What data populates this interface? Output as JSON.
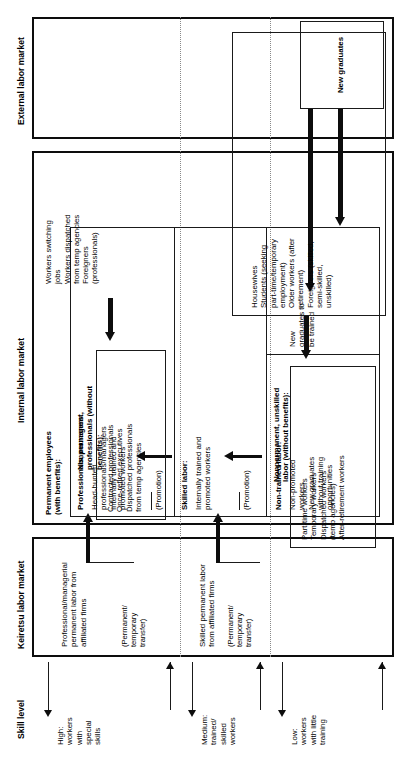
{
  "figure": {
    "axis_label": "Skill level"
  },
  "columns": [
    {
      "id": "skill-level",
      "label": "Skill level"
    },
    {
      "id": "keiretsu",
      "label": "Keiretsu labor market"
    },
    {
      "id": "internal",
      "label": "Internal labor market"
    },
    {
      "id": "external",
      "label": "External labor market"
    }
  ],
  "skill_bands": [
    {
      "id": "high",
      "label": "High:\nworkers\nwith\nspecial\nskills"
    },
    {
      "id": "medium",
      "label": "Medium:\ntrained/\nskilled\nworkers"
    },
    {
      "id": "low",
      "label": "Low:\nworkers\nwith little\ntraining"
    }
  ],
  "keiretsu": {
    "high": {
      "text": "Professional/managerial\npermanent labor from\naffiliated firms",
      "transfer_note": "(Permanent/\ntemporary\ntransfer)"
    },
    "medium": {
      "text": "Skilled permanent labor\nfrom affiliated firms",
      "transfer_note": "(Permanent/\ntemporary\ntransfer)"
    },
    "low": {
      "text": ""
    }
  },
  "internal": {
    "permanent": {
      "heading": "Permanent employees\n(with benefits):",
      "groups": [
        {
          "heading": "Professionals, managers:",
          "items": "Head-hunted\nprofessionals/managers\nInternally trained and\npromoted workers",
          "promotion_note": "(Promotion)"
        },
        {
          "heading": "Skilled labor:",
          "items": "Internally trained and\npromoted workers",
          "promotion_note": "(Promotion)"
        },
        {
          "heading": "Non-trained labor:",
          "items": "Non-promoted\nworkers\nNew graduates\nwithout training\nopportunities",
          "side_note": "New\ngraduates to\nbe trained"
        }
      ]
    },
    "nonpermanent_professionals": {
      "heading": "Nonpermanent,\nprofessionals (without\nbenefits):",
      "items": "Contracted professionals\nOnce-retired executives\nDispatched professionals\nfrom temp agencies"
    },
    "nonpermanent_unskilled": {
      "heading": "Nonpermanent, unskilled\nlabor (without benefits):",
      "items": "Part-time workers\nTemporary workers\nDispatched workers\n(temp agencies)\nAfter-retirement workers"
    }
  },
  "external": {
    "professional_pool": {
      "items": "Workers switching\njobs\nWorkers dispatched\nfrom temp agencies\nForeigners\n(professionals)"
    },
    "unskilled_pool": {
      "items": "Housewives\nStudents (seeking\npart-time/temporary\nemployment)\nOlder workers (after\nretirement)\nForeigners (skilled,\nsemi-skilled,\nunskilled)"
    }
  },
  "new_graduates": {
    "label": "New graduates"
  },
  "colors": {
    "line": "#111111",
    "dashed": "#7a7a7a",
    "background": "#ffffff"
  }
}
